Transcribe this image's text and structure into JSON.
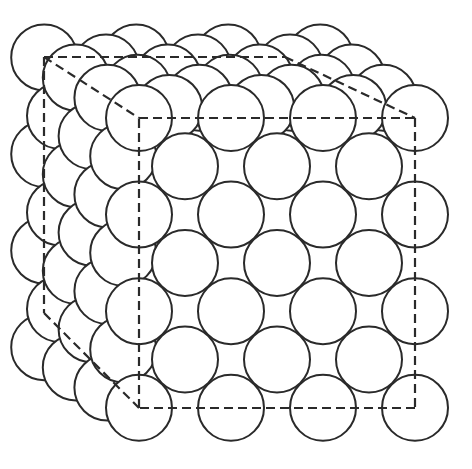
{
  "diagram": {
    "type": "crystal-lattice-packing",
    "colors": {
      "background": "#ffffff",
      "sphere_fill": "#ffffff",
      "stroke": "#2a2a2a",
      "dash": "#2a2a2a"
    },
    "lattice": {
      "origin": [
        139,
        118
      ],
      "step_x": [
        46,
        0
      ],
      "step_y": [
        0,
        48.3
      ],
      "step_z": [
        -15.8,
        -10.1
      ],
      "half_steps": 6,
      "radius": 33
    },
    "cube": {
      "front": [
        [
          139,
          118
        ],
        [
          415,
          118
        ],
        [
          415,
          408
        ],
        [
          139,
          408
        ]
      ],
      "back_visible_edges": [
        [
          [
            44,
            57
          ],
          [
            139,
            118
          ]
        ],
        [
          [
            44,
            57
          ],
          [
            44,
            313
          ]
        ],
        [
          [
            44,
            313
          ],
          [
            139,
            408
          ]
        ],
        [
          [
            44,
            57
          ],
          [
            285,
            57
          ]
        ],
        [
          [
            285,
            57
          ],
          [
            415,
            118
          ]
        ]
      ]
    }
  }
}
